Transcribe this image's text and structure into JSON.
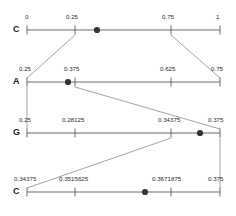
{
  "diagram": {
    "type": "arithmetic-coding-interval-subdivision",
    "geometry": {
      "axis_left_px": 27,
      "axis_right_px": 220,
      "tick_height_px": 9,
      "row_y_px": [
        30,
        82,
        133,
        192
      ],
      "label_y_px": [
        14,
        66,
        117,
        176
      ]
    },
    "colors": {
      "axis": "#5a5a5a",
      "connector": "#8a8a8a",
      "marker": "#333333",
      "text": "#2b2b2b",
      "row_label": "#1a1a1a",
      "background": "#ffffff"
    },
    "rows": [
      {
        "symbol": "C",
        "axis_y": 30,
        "label_y": 14,
        "ticks": [
          {
            "x": 27,
            "label": "0",
            "label_x": 25,
            "label_anchor": "start"
          },
          {
            "x": 75,
            "label": "0.25",
            "label_x": 66,
            "label_anchor": "start"
          },
          {
            "x": 171,
            "label": "0.75",
            "label_x": 162,
            "label_anchor": "start"
          },
          {
            "x": 220,
            "label": "1",
            "label_x": 216,
            "label_anchor": "start"
          }
        ],
        "marker_x": 97
      },
      {
        "symbol": "A",
        "axis_y": 82,
        "label_y": 66,
        "ticks": [
          {
            "x": 27,
            "label": "0.25",
            "label_x": 19,
            "label_anchor": "start"
          },
          {
            "x": 75,
            "label": "0.375",
            "label_x": 64,
            "label_anchor": "start"
          },
          {
            "x": 171,
            "label": "0.625",
            "label_x": 160,
            "label_anchor": "start"
          },
          {
            "x": 220,
            "label": "0.75",
            "label_x": 211,
            "label_anchor": "start"
          }
        ],
        "marker_x": 68
      },
      {
        "symbol": "G",
        "axis_y": 133,
        "label_y": 117,
        "ticks": [
          {
            "x": 27,
            "label": "0.25",
            "label_x": 19,
            "label_anchor": "start"
          },
          {
            "x": 75,
            "label": "0.28125",
            "label_x": 62,
            "label_anchor": "start"
          },
          {
            "x": 171,
            "label": "0.34375",
            "label_x": 158,
            "label_anchor": "start"
          },
          {
            "x": 220,
            "label": "0.375",
            "label_x": 208,
            "label_anchor": "start"
          }
        ],
        "marker_x": 200
      },
      {
        "symbol": "C",
        "axis_y": 192,
        "label_y": 176,
        "ticks": [
          {
            "x": 27,
            "label": "0.34375",
            "label_x": 14,
            "label_anchor": "start"
          },
          {
            "x": 75,
            "label": "0.3515625",
            "label_x": 59,
            "label_anchor": "start"
          },
          {
            "x": 171,
            "label": "0.3671875",
            "label_x": 152,
            "label_anchor": "start"
          },
          {
            "x": 220,
            "label": "0.375",
            "label_x": 208,
            "label_anchor": "start"
          }
        ],
        "marker_x": 145
      }
    ],
    "connectors": [
      {
        "from_x": 75,
        "from_y": 35,
        "to_x": 27,
        "to_y": 78,
        "from_row": 0,
        "to_row": 1
      },
      {
        "from_x": 171,
        "from_y": 35,
        "to_x": 220,
        "to_y": 78,
        "from_row": 0,
        "to_row": 1
      },
      {
        "from_x": 27,
        "from_y": 87,
        "to_x": 27,
        "to_y": 129,
        "from_row": 1,
        "to_row": 2
      },
      {
        "from_x": 75,
        "from_y": 87,
        "to_x": 220,
        "to_y": 129,
        "from_row": 1,
        "to_row": 2
      },
      {
        "from_x": 171,
        "from_y": 138,
        "to_x": 27,
        "to_y": 188,
        "from_row": 2,
        "to_row": 3
      },
      {
        "from_x": 220,
        "from_y": 138,
        "to_x": 220,
        "to_y": 188,
        "from_row": 2,
        "to_row": 3
      }
    ]
  }
}
